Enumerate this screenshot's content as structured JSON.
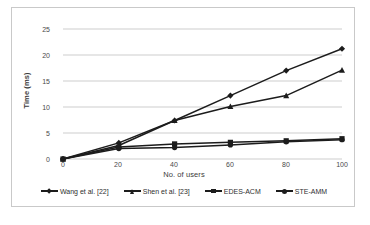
{
  "figure": {
    "caption": ""
  },
  "axes": {
    "y_title": "Time (ms)",
    "x_title": "No. of users",
    "y_ticks": [
      "0",
      "5",
      "10",
      "15",
      "20",
      "25"
    ],
    "x_ticks": [
      "0",
      "20",
      "40",
      "60",
      "80",
      "100"
    ]
  },
  "legend": {
    "items": [
      {
        "label": "Wang et al. [22]",
        "marker": "diamond",
        "color": "#1c1c1c"
      },
      {
        "label": "Shen et al. [23]",
        "marker": "tri",
        "color": "#1c1c1c"
      },
      {
        "label": "EDES-ACM",
        "marker": "square",
        "color": "#1c1c1c"
      },
      {
        "label": "STE-AMM",
        "marker": "circle",
        "color": "#1c1c1c"
      }
    ]
  },
  "chart_data": {
    "type": "line",
    "title": "",
    "xlabel": "No. of users",
    "ylabel": "Time (ms)",
    "x": [
      0,
      20,
      40,
      60,
      80,
      100
    ],
    "xlim": [
      0,
      100
    ],
    "ylim": [
      0,
      25
    ],
    "grid": "horizontal",
    "legend_position": "bottom",
    "series": [
      {
        "name": "Wang et al. [22]",
        "marker": "diamond",
        "values": [
          0,
          3.1,
          7.4,
          12.2,
          17.0,
          21.2
        ]
      },
      {
        "name": "Shen et al. [23]",
        "marker": "triangle",
        "values": [
          0,
          2.6,
          7.4,
          10.1,
          12.2,
          17.1
        ]
      },
      {
        "name": "EDES-ACM",
        "marker": "square",
        "values": [
          0,
          2.3,
          2.9,
          3.2,
          3.5,
          3.9
        ]
      },
      {
        "name": "STE-AMM",
        "marker": "circle",
        "values": [
          0,
          2.0,
          2.2,
          2.7,
          3.3,
          3.7
        ]
      }
    ]
  }
}
